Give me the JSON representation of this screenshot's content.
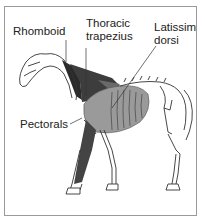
{
  "figure": {
    "labels": {
      "rhomboid": "Rhomboid",
      "thoracic_trapezius_line1": "Thoracic",
      "thoracic_trapezius_line2": "trapezius",
      "latissimus_line1": "Latissim",
      "latissimus_line2": "dorsi",
      "pectorals": "Pectorals"
    },
    "colors": {
      "border": "#9a9a9a",
      "trapezius_dark": "#3a3a3a",
      "rhomboid_dark": "#2a2a2a",
      "latissimus_gray": "#8a8a8a",
      "pectoral_dark": "#444444",
      "bone_outline": "#333333"
    }
  }
}
